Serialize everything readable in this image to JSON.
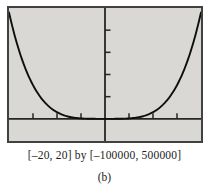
{
  "figure": {
    "caption": "[–20, 20] by [–100000, 500000]",
    "sublabel": "(b)"
  },
  "chart_data": {
    "type": "line",
    "title": "",
    "xlabel": "",
    "ylabel": "",
    "window": {
      "xmin": -20,
      "xmax": 20,
      "ymin": -100000,
      "ymax": 500000
    },
    "xscl": 5,
    "yscl": 100000,
    "x_ticks": [
      -15,
      -10,
      -5,
      5,
      10,
      15
    ],
    "y_ticks": [
      100000,
      200000,
      300000,
      400000
    ],
    "grid": false,
    "legend": "none",
    "curve": {
      "description": "U-shaped even-power curve, symmetric about the y-axis, flat near origin, rising to top of window at both edges",
      "equation_estimate": "y = 3x^4",
      "coefficient": 3,
      "exponent": 4,
      "samples": [
        [
          -20,
          480000
        ],
        [
          -17.5,
          281367
        ],
        [
          -15,
          151875
        ],
        [
          -12.5,
          73242
        ],
        [
          -10,
          30000
        ],
        [
          -7.5,
          9492
        ],
        [
          -5,
          1875
        ],
        [
          -2.5,
          117
        ],
        [
          0,
          0
        ],
        [
          2.5,
          117
        ],
        [
          5,
          1875
        ],
        [
          7.5,
          9492
        ],
        [
          10,
          30000
        ],
        [
          12.5,
          73242
        ],
        [
          15,
          151875
        ],
        [
          17.5,
          281367
        ],
        [
          20,
          480000
        ]
      ]
    }
  },
  "colors": {
    "page_bg": "#ffffff",
    "screen_bg": "#d9d8d4",
    "frame": "#414141",
    "axis": "#262626",
    "curve": "#0e0e0e",
    "caption": "#1c1c1c"
  }
}
